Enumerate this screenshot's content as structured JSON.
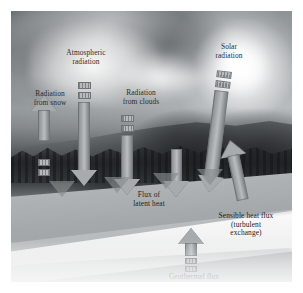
{
  "figure": {
    "type": "annotated photograph diagram",
    "palette": {
      "sky": "#9ba0a2",
      "forest": "#2c3032",
      "snow_top": "#aeb2b4",
      "snow_front": "#f4f4f4",
      "arrow_fill": "#a9adaf",
      "arrow_outline": "#5a5e60",
      "label_text": "#2b2d2e"
    }
  },
  "labels": {
    "radiation_from_snow": "Radiation\nfrom snow",
    "atmospheric_radiation": "Atmospheric\nradiation",
    "radiation_from_clouds": "Radiation\nfrom clouds",
    "solar_radiation": "Solar\nradiation",
    "flux_of_latent_heat": "Flux of\nlatent heat",
    "sensible_heat_flux": "Sensible heat flux\n(turbulent\nexchange)",
    "geothermal_flux": "Geothermal flux"
  },
  "fluxes": [
    {
      "name": "radiation-from-snow",
      "label": "Radiation from snow",
      "direction": "up",
      "origin": "snow surface",
      "segments": 2
    },
    {
      "name": "atmospheric-radiation",
      "label": "Atmospheric radiation",
      "direction": "down",
      "origin": "atmosphere",
      "segments": 2
    },
    {
      "name": "radiation-from-clouds",
      "label": "Radiation from clouds",
      "direction": "down",
      "origin": "clouds",
      "segments": 2
    },
    {
      "name": "solar-radiation",
      "label": "Solar radiation",
      "direction": "down-slanted",
      "origin": "sun",
      "segments": 2
    },
    {
      "name": "flux-of-latent-heat",
      "label": "Flux of latent heat",
      "direction": "down",
      "origin": "air",
      "segments": 0
    },
    {
      "name": "sensible-heat-flux",
      "label": "Sensible heat flux (turbulent exchange)",
      "direction": "up-slanted",
      "origin": "snow surface",
      "segments": 0
    },
    {
      "name": "geothermal-flux",
      "label": "Geothermal flux",
      "direction": "up",
      "origin": "ground below",
      "segments": 2
    }
  ],
  "scene": {
    "sky_description": "cloudy sky with bright sun glow at upper right",
    "foreground_description": "dark coniferous forest hillside",
    "surface_description": "white snow slab shown as a 3D block in perspective"
  }
}
